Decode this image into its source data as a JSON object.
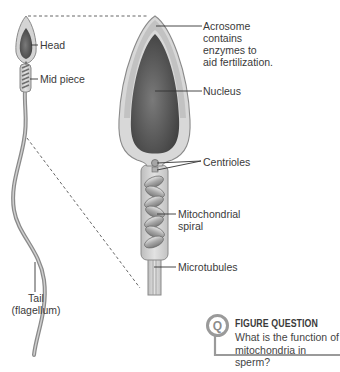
{
  "figure": {
    "type": "labeled-anatomy-diagram",
    "whole_cell_labels": {
      "head": "Head",
      "mid_piece": "Mid piece",
      "tail_line1": "Tail",
      "tail_line2": "(flagellum)"
    },
    "enlarged_labels": {
      "acrosome": [
        "Acrosome",
        "contains",
        "enzymes to",
        "aid fertilization."
      ],
      "nucleus": "Nucleus",
      "centrioles": "Centrioles",
      "mitochondrial_spiral": [
        "Mitochondrial",
        "spiral"
      ],
      "microtubules": "Microtubules"
    },
    "colors": {
      "outline": "#8a8a8a",
      "cytoplasm": "#d6d6d6",
      "nucleus_dark": "#4a4a4a",
      "nucleus_mid": "#6e6e6e",
      "leader_line": "#333333",
      "dashed_line": "#555555"
    }
  },
  "figure_question": {
    "badge": "Q",
    "title": "FIGURE QUESTION",
    "line1": "What is the function of",
    "line2": "mitochondria in sperm?"
  }
}
